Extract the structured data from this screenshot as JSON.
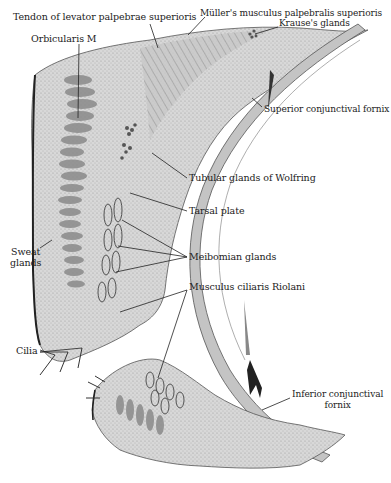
{
  "figure": {
    "labels": [
      {
        "id": "tendon-levator",
        "text": "Tendon of levator palpebrae superioris",
        "x": 13,
        "y": 17
      },
      {
        "id": "orbicularis",
        "text": "Orbicularis M",
        "x": 31,
        "y": 37
      },
      {
        "id": "muller",
        "text": "Müller's musculus palpebralis superioris",
        "x": 200,
        "y": 13
      },
      {
        "id": "krause",
        "text": "Krause's glands",
        "x": 279,
        "y": 22
      },
      {
        "id": "superior-fornix",
        "text": "Superior conjunctival fornix",
        "x": 264,
        "y": 107
      },
      {
        "id": "wolfring",
        "text": "Tubular glands of Wolfring",
        "x": 189,
        "y": 176
      },
      {
        "id": "tarsal-plate",
        "text": "Tarsal plate",
        "x": 189,
        "y": 209
      },
      {
        "id": "sweat-glands",
        "text": "Sweat\nglands",
        "x": 12,
        "y": 246
      },
      {
        "id": "meibomian",
        "text": "Meibomian glands",
        "x": 189,
        "y": 255
      },
      {
        "id": "ciliaris",
        "text": "Musculus ciliaris Riolani",
        "x": 189,
        "y": 285
      },
      {
        "id": "cilia",
        "text": "Cilia",
        "x": 17,
        "y": 346
      },
      {
        "id": "inferior-fornix",
        "text": "Inferior conjunctival\nfornix",
        "x": 292,
        "y": 392
      }
    ],
    "colors": {
      "ink": "#222222",
      "tissue_light": "#dcdcdc",
      "tissue_mid": "#b8b8b8",
      "tissue_dark": "#6e6e6e",
      "background": "#ffffff"
    }
  }
}
